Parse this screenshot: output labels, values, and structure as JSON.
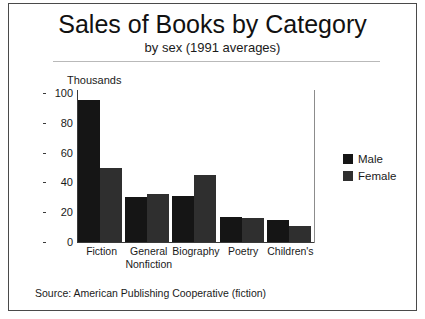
{
  "figure": {
    "title": "Sales of Books by Category",
    "subtitle": "by sex (1991 averages)",
    "source_note": "Source: American Publishing Cooperative (fiction)"
  },
  "legend": {
    "items": [
      {
        "label": "Male",
        "color": "#151515"
      },
      {
        "label": "Female",
        "color": "#2f2f2f"
      }
    ]
  },
  "axis": {
    "unit_label": "Thousands",
    "y_ticks": [
      "0",
      "20",
      "40",
      "60",
      "80",
      "100"
    ]
  },
  "categories": [
    {
      "line1": "Fiction",
      "line2": ""
    },
    {
      "line1": "General",
      "line2": "Nonfiction"
    },
    {
      "line1": "Biography",
      "line2": ""
    },
    {
      "line1": "Poetry",
      "line2": ""
    },
    {
      "line1": "Children's",
      "line2": ""
    }
  ],
  "chart_data": {
    "type": "bar",
    "title": "Sales of Books by Category",
    "subtitle": "by sex (1991 averages)",
    "xlabel": "",
    "ylabel": "Thousands",
    "ylim": [
      0,
      100
    ],
    "yticks": [
      0,
      20,
      40,
      60,
      80,
      100
    ],
    "grid": false,
    "legend_position": "right",
    "categories": [
      "Fiction",
      "General Nonfiction",
      "Biography",
      "Poetry",
      "Children's"
    ],
    "series": [
      {
        "name": "Male",
        "color": "#151515",
        "values": [
          95,
          30,
          31,
          17,
          15
        ]
      },
      {
        "name": "Female",
        "color": "#2f2f2f",
        "values": [
          50,
          32,
          45,
          16,
          11
        ]
      }
    ],
    "source": "American Publishing Cooperative (fiction)"
  }
}
